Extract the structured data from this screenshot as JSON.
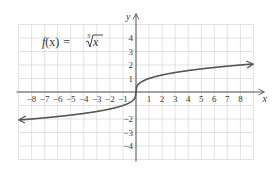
{
  "chart_data": {
    "type": "line",
    "title": "",
    "function_label": {
      "prefix": "f",
      "arg": "(x)",
      "equals": "=",
      "radical_index": "3",
      "radicand": "x"
    },
    "xlabel": "x",
    "ylabel": "y",
    "xlim": [
      -9,
      9
    ],
    "ylim": [
      -5,
      5
    ],
    "grid": true,
    "x_tick_labels": [
      "−8",
      "−7",
      "−6",
      "−5",
      "−4",
      "−3",
      "−2",
      "−1",
      "1",
      "2",
      "3",
      "4",
      "5",
      "6",
      "7",
      "8"
    ],
    "x_ticks": [
      -8,
      -7,
      -6,
      -5,
      -4,
      -3,
      -2,
      -1,
      1,
      2,
      3,
      4,
      5,
      6,
      7,
      8
    ],
    "y_tick_labels": [
      "4",
      "3",
      "2",
      "1",
      "−2",
      "−3",
      "−4"
    ],
    "y_ticks": [
      4,
      3,
      2,
      1,
      -2,
      -3,
      -4
    ],
    "series": [
      {
        "name": "f(x) = cube root of x",
        "x": [
          -8.9,
          -8,
          -6,
          -4,
          -2,
          -1,
          -0.5,
          -0.125,
          0,
          0.125,
          0.5,
          1,
          2,
          4,
          6,
          8,
          8.9
        ],
        "values": [
          -2.07,
          -2,
          -1.82,
          -1.59,
          -1.26,
          -1,
          -0.79,
          -0.5,
          0,
          0.5,
          0.79,
          1,
          1.26,
          1.59,
          1.82,
          2,
          2.07
        ],
        "arrows": "both ends"
      }
    ],
    "colors": {
      "curve": "#555555",
      "axes": "#555555",
      "grid": "#d4d4d4"
    }
  }
}
